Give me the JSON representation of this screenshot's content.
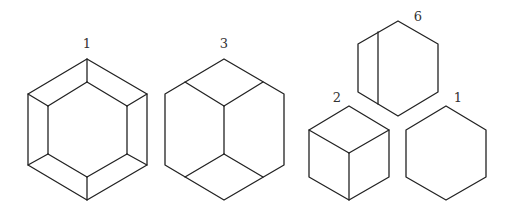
{
  "figures": [
    {
      "id": "hex-beveled",
      "label": "1",
      "label_pos": [
        87,
        48
      ],
      "outer": [
        [
          87,
          59
        ],
        [
          28,
          94
        ],
        [
          28,
          165
        ],
        [
          87,
          200
        ],
        [
          147,
          165
        ],
        [
          147,
          94
        ]
      ],
      "lines": [
        [
          [
            87,
            82
          ],
          [
            48,
            106
          ]
        ],
        [
          [
            48,
            106
          ],
          [
            48,
            154
          ]
        ],
        [
          [
            48,
            154
          ],
          [
            87,
            177
          ]
        ],
        [
          [
            87,
            177
          ],
          [
            127,
            154
          ]
        ],
        [
          [
            127,
            154
          ],
          [
            127,
            106
          ]
        ],
        [
          [
            127,
            106
          ],
          [
            87,
            82
          ]
        ],
        [
          [
            87,
            59
          ],
          [
            87,
            82
          ]
        ],
        [
          [
            28,
            94
          ],
          [
            48,
            106
          ]
        ],
        [
          [
            28,
            165
          ],
          [
            48,
            154
          ]
        ],
        [
          [
            87,
            200
          ],
          [
            87,
            177
          ]
        ],
        [
          [
            147,
            165
          ],
          [
            127,
            154
          ]
        ],
        [
          [
            147,
            94
          ],
          [
            127,
            106
          ]
        ]
      ]
    },
    {
      "id": "hex-three-faces",
      "label": "3",
      "label_pos": [
        224,
        48
      ],
      "outer": [
        [
          224,
          59
        ],
        [
          165,
          94
        ],
        [
          165,
          165
        ],
        [
          224,
          200
        ],
        [
          284,
          165
        ],
        [
          284,
          94
        ]
      ],
      "lines": [
        [
          [
            185,
            82
          ],
          [
            224,
            106
          ]
        ],
        [
          [
            263,
            82
          ],
          [
            224,
            106
          ]
        ],
        [
          [
            224,
            106
          ],
          [
            224,
            154
          ]
        ],
        [
          [
            224,
            154
          ],
          [
            185,
            177
          ]
        ],
        [
          [
            224,
            154
          ],
          [
            263,
            177
          ]
        ]
      ]
    },
    {
      "id": "hex-split",
      "label": "6",
      "label_pos": [
        418,
        21
      ],
      "outer": [
        [
          398,
          21
        ],
        [
          358,
          44
        ],
        [
          358,
          92
        ],
        [
          398,
          116
        ],
        [
          438,
          92
        ],
        [
          438,
          44
        ]
      ],
      "lines": [
        [
          [
            378,
            32
          ],
          [
            378,
            104
          ]
        ]
      ]
    },
    {
      "id": "cube",
      "label": "2",
      "label_pos": [
        337,
        102
      ],
      "outer": [
        [
          349,
          106
        ],
        [
          309,
          130
        ],
        [
          309,
          177
        ],
        [
          349,
          200
        ],
        [
          389,
          177
        ],
        [
          389,
          130
        ]
      ],
      "lines": [
        [
          [
            309,
            130
          ],
          [
            349,
            153
          ]
        ],
        [
          [
            389,
            130
          ],
          [
            349,
            153
          ]
        ],
        [
          [
            349,
            153
          ],
          [
            349,
            200
          ]
        ]
      ]
    },
    {
      "id": "hex-plain",
      "label": "1",
      "label_pos": [
        458,
        102
      ],
      "outer": [
        [
          446,
          106
        ],
        [
          406,
          130
        ],
        [
          406,
          177
        ],
        [
          446,
          200
        ],
        [
          486,
          177
        ],
        [
          486,
          130
        ]
      ],
      "lines": []
    }
  ]
}
